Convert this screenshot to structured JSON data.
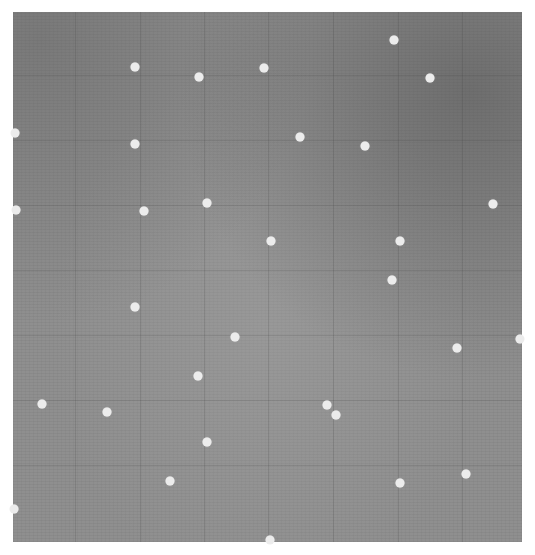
{
  "image": {
    "description": "Grayscale photograph of a textured gray surface with faint grid lines and scattered white dots",
    "background_color": "#8f8f8f",
    "dot_color": "#ececec",
    "frame": {
      "x": 13,
      "y": 12,
      "width": 509,
      "height": 530
    },
    "grid_x": [
      75,
      140,
      204,
      268,
      333,
      398,
      462
    ],
    "grid_y": [
      75,
      140,
      205,
      270,
      335,
      400,
      465
    ],
    "dots": [
      {
        "x": 135,
        "y": 67
      },
      {
        "x": 199,
        "y": 77
      },
      {
        "x": 264,
        "y": 68
      },
      {
        "x": 394,
        "y": 40
      },
      {
        "x": 430,
        "y": 78
      },
      {
        "x": 15,
        "y": 133
      },
      {
        "x": 135,
        "y": 144
      },
      {
        "x": 300,
        "y": 137
      },
      {
        "x": 365,
        "y": 146
      },
      {
        "x": 16,
        "y": 210
      },
      {
        "x": 144,
        "y": 211
      },
      {
        "x": 207,
        "y": 203
      },
      {
        "x": 271,
        "y": 241
      },
      {
        "x": 400,
        "y": 241
      },
      {
        "x": 493,
        "y": 204
      },
      {
        "x": 392,
        "y": 280
      },
      {
        "x": 135,
        "y": 307
      },
      {
        "x": 235,
        "y": 337
      },
      {
        "x": 457,
        "y": 348
      },
      {
        "x": 520,
        "y": 339
      },
      {
        "x": 198,
        "y": 376
      },
      {
        "x": 42,
        "y": 404
      },
      {
        "x": 107,
        "y": 412
      },
      {
        "x": 327,
        "y": 405
      },
      {
        "x": 336,
        "y": 415
      },
      {
        "x": 207,
        "y": 442
      },
      {
        "x": 170,
        "y": 481
      },
      {
        "x": 400,
        "y": 483
      },
      {
        "x": 466,
        "y": 474
      },
      {
        "x": 14,
        "y": 509
      },
      {
        "x": 270,
        "y": 540
      }
    ]
  }
}
